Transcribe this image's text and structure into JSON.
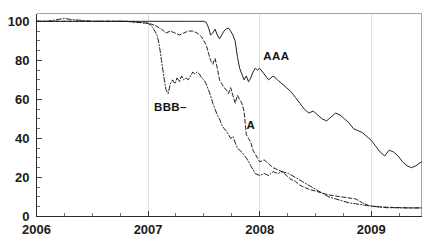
{
  "chart_data": {
    "type": "line",
    "title": "",
    "subtitle": "",
    "xlabel": "",
    "ylabel": "",
    "xlim": [
      2006.0,
      2009.45
    ],
    "ylim": [
      0,
      104
    ],
    "grid": "vertical gridlines at year boundaries 2007, 2008, 2009",
    "legend_position": "inline annotations on plot",
    "x_tick_labels": [
      "2006",
      "2007",
      "2008",
      "2009"
    ],
    "x_tick_values": [
      2006,
      2007,
      2008,
      2009
    ],
    "x_minor_tick_step": 0.25,
    "y_tick_labels": [
      "0",
      "20",
      "40",
      "60",
      "80",
      "100"
    ],
    "y_tick_values": [
      0,
      20,
      40,
      60,
      80,
      100
    ],
    "y_minor_tick_step": 5,
    "annotations": [
      {
        "text": "AAA",
        "x": 2008.15,
        "y": 80,
        "series": "AAA"
      },
      {
        "text": "BBB–",
        "x": 2007.2,
        "y": 54,
        "series": "BBB-"
      },
      {
        "text": "A",
        "x": 2007.92,
        "y": 45,
        "series": "A"
      }
    ],
    "series": [
      {
        "name": "AAA",
        "line_style": "solid",
        "color": "#171717",
        "x": [
          2006.0,
          2006.08,
          2006.17,
          2006.25,
          2006.33,
          2006.42,
          2006.5,
          2006.58,
          2006.67,
          2006.75,
          2006.83,
          2006.92,
          2007.0,
          2007.08,
          2007.17,
          2007.25,
          2007.33,
          2007.38,
          2007.42,
          2007.46,
          2007.5,
          2007.52,
          2007.54,
          2007.56,
          2007.58,
          2007.6,
          2007.62,
          2007.64,
          2007.66,
          2007.68,
          2007.7,
          2007.72,
          2007.74,
          2007.76,
          2007.78,
          2007.8,
          2007.82,
          2007.84,
          2007.86,
          2007.88,
          2007.9,
          2007.92,
          2007.94,
          2007.96,
          2007.98,
          2008.0,
          2008.04,
          2008.08,
          2008.12,
          2008.16,
          2008.2,
          2008.24,
          2008.28,
          2008.32,
          2008.36,
          2008.4,
          2008.44,
          2008.48,
          2008.52,
          2008.56,
          2008.6,
          2008.64,
          2008.68,
          2008.72,
          2008.76,
          2008.8,
          2008.84,
          2008.88,
          2008.92,
          2008.96,
          2009.0,
          2009.04,
          2009.08,
          2009.12,
          2009.16,
          2009.2,
          2009.24,
          2009.28,
          2009.32,
          2009.36,
          2009.4,
          2009.45
        ],
        "y": [
          100,
          100,
          100,
          100,
          100,
          100,
          100,
          100,
          100,
          100,
          100,
          100,
          100,
          100,
          100,
          100,
          100,
          100,
          100,
          100,
          100,
          99.5,
          97,
          93,
          94,
          96,
          93,
          91,
          93,
          95,
          96,
          96.5,
          95,
          93,
          90,
          82,
          76,
          73,
          70,
          72,
          69,
          71,
          74,
          76,
          75,
          76,
          73,
          70,
          72,
          70,
          68,
          66,
          64,
          61,
          58,
          55,
          53,
          54,
          52,
          50,
          49,
          51,
          53,
          52,
          50,
          48,
          45,
          44,
          43,
          41,
          39,
          36,
          33,
          31,
          34,
          33,
          31,
          28,
          26,
          25,
          26,
          28
        ]
      },
      {
        "name": "A",
        "line_style": "dashed",
        "color": "#171717",
        "x": [
          2006.0,
          2006.1,
          2006.2,
          2006.3,
          2006.4,
          2006.5,
          2006.6,
          2006.7,
          2006.8,
          2006.9,
          2007.0,
          2007.06,
          2007.12,
          2007.16,
          2007.2,
          2007.24,
          2007.28,
          2007.32,
          2007.36,
          2007.4,
          2007.44,
          2007.48,
          2007.52,
          2007.56,
          2007.58,
          2007.6,
          2007.62,
          2007.64,
          2007.66,
          2007.68,
          2007.7,
          2007.72,
          2007.74,
          2007.76,
          2007.78,
          2007.8,
          2007.82,
          2007.84,
          2007.86,
          2007.88,
          2007.9,
          2007.92,
          2007.94,
          2007.96,
          2007.98,
          2008.0,
          2008.04,
          2008.08,
          2008.12,
          2008.16,
          2008.2,
          2008.24,
          2008.28,
          2008.32,
          2008.36,
          2008.4,
          2008.44,
          2008.5,
          2008.56,
          2008.62,
          2008.68,
          2008.74,
          2008.8,
          2008.86,
          2008.92,
          2008.98,
          2009.04,
          2009.12,
          2009.2,
          2009.28,
          2009.36,
          2009.45
        ],
        "y": [
          100,
          100,
          100,
          100,
          100,
          100,
          100,
          100,
          100,
          99.5,
          99,
          98,
          96,
          94,
          95,
          94,
          93,
          94,
          95,
          95,
          94,
          92,
          88,
          80,
          78,
          81,
          76,
          70,
          68,
          66,
          65,
          63,
          66,
          62,
          58,
          62,
          60,
          58,
          54,
          42,
          40,
          38,
          34,
          32,
          30,
          28,
          29,
          27,
          25,
          24,
          23,
          21,
          19,
          18,
          16,
          15,
          14,
          13,
          12,
          11,
          10.5,
          10,
          9.5,
          9,
          7,
          5.5,
          5,
          4.8,
          4.6,
          4.5,
          4.4,
          4.4
        ]
      },
      {
        "name": "BBB-",
        "line_style": "dash-dot",
        "color": "#171717",
        "x": [
          2006.0,
          2006.1,
          2006.2,
          2006.25,
          2006.3,
          2006.4,
          2006.5,
          2006.6,
          2006.7,
          2006.8,
          2006.9,
          2007.0,
          2007.04,
          2007.08,
          2007.1,
          2007.12,
          2007.14,
          2007.16,
          2007.18,
          2007.2,
          2007.22,
          2007.24,
          2007.26,
          2007.28,
          2007.3,
          2007.32,
          2007.34,
          2007.36,
          2007.38,
          2007.4,
          2007.42,
          2007.44,
          2007.46,
          2007.48,
          2007.5,
          2007.52,
          2007.54,
          2007.56,
          2007.58,
          2007.6,
          2007.62,
          2007.64,
          2007.66,
          2007.68,
          2007.7,
          2007.72,
          2007.74,
          2007.76,
          2007.78,
          2007.8,
          2007.84,
          2007.88,
          2007.92,
          2007.96,
          2008.0,
          2008.04,
          2008.08,
          2008.12,
          2008.16,
          2008.2,
          2008.26,
          2008.32,
          2008.38,
          2008.44,
          2008.5,
          2008.56,
          2008.62,
          2008.68,
          2008.74,
          2008.8,
          2008.86,
          2008.92,
          2008.98,
          2009.06,
          2009.14,
          2009.22,
          2009.3,
          2009.38,
          2009.45
        ],
        "y": [
          100,
          100,
          101,
          101.5,
          101,
          100.5,
          100,
          100,
          100,
          100,
          99.5,
          99,
          97,
          93,
          88,
          80,
          72,
          65,
          63,
          68,
          70,
          68,
          71,
          69,
          72,
          70,
          71,
          70,
          72,
          74,
          73,
          74,
          73,
          71,
          70,
          68,
          65,
          62,
          58,
          55,
          52,
          50,
          47,
          45,
          44,
          42,
          40,
          41,
          38,
          35,
          33,
          30,
          26,
          22,
          21,
          22,
          21,
          23,
          22,
          23,
          22,
          20,
          18,
          16,
          14,
          12,
          10,
          9,
          8,
          7,
          6.5,
          6,
          5.5,
          5,
          4.5,
          4.5,
          4.4,
          4.4,
          4.4
        ]
      }
    ]
  }
}
